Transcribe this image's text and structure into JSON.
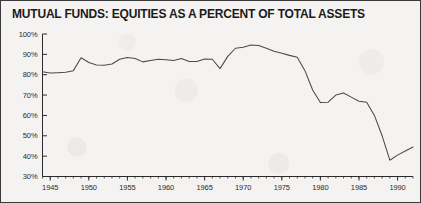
{
  "figure": {
    "title": "MUTUAL FUNDS: EQUITIES AS A PERCENT OF TOTAL ASSETS",
    "border_color": "#3a3a3a",
    "background_color": "#f4f3f1",
    "line_color": "#4a4a4a",
    "axis_color": "#2b2b2b"
  },
  "chart_data": {
    "type": "line",
    "title": "MUTUAL FUNDS: EQUITIES AS A PERCENT OF TOTAL ASSETS",
    "xlabel": "",
    "ylabel": "",
    "xlim": [
      1944,
      1992
    ],
    "ylim": [
      30,
      100
    ],
    "ytick_values": [
      100,
      90,
      80,
      70,
      60,
      50,
      40,
      30
    ],
    "ytick_labels": [
      "100%",
      "90%",
      "80%",
      "70%",
      "60%",
      "50%",
      "40%",
      "30%"
    ],
    "xtick_values": [
      1945,
      1950,
      1955,
      1960,
      1965,
      1970,
      1975,
      1980,
      1985,
      1990
    ],
    "xtick_labels": [
      "1945",
      "1950",
      "1955",
      "1960",
      "1965",
      "1970",
      "1975",
      "1980",
      "1985",
      "1990"
    ],
    "xtick_minor_step": 1,
    "grid": false,
    "legend": null,
    "series": [
      {
        "name": "Equities as a percent of total assets",
        "x": [
          1944,
          1945,
          1946,
          1947,
          1948,
          1949,
          1950,
          1951,
          1952,
          1953,
          1954,
          1955,
          1956,
          1957,
          1958,
          1959,
          1960,
          1961,
          1962,
          1963,
          1964,
          1965,
          1966,
          1967,
          1968,
          1969,
          1970,
          1971,
          1972,
          1973,
          1974,
          1975,
          1976,
          1977,
          1978,
          1979,
          1980,
          1981,
          1982,
          1983,
          1984,
          1985,
          1986,
          1987,
          1988,
          1989,
          1990,
          1991,
          1992
        ],
        "values": [
          81.5,
          80.8,
          81.0,
          81.2,
          82.0,
          88.3,
          86.0,
          84.8,
          84.7,
          85.3,
          87.6,
          88.5,
          88.0,
          86.3,
          87.0,
          87.6,
          87.3,
          87.0,
          88.0,
          86.5,
          86.5,
          87.7,
          87.6,
          83.0,
          89.0,
          93.0,
          93.5,
          94.6,
          94.3,
          93.0,
          91.5,
          90.5,
          89.5,
          88.6,
          82.0,
          72.5,
          66.3,
          66.5,
          70.0,
          71.0,
          69.0,
          67.0,
          66.5,
          60.0,
          50.0,
          38.0,
          40.5,
          42.5,
          44.5
        ]
      }
    ]
  },
  "axis": {
    "y_title": "",
    "x_title": ""
  }
}
